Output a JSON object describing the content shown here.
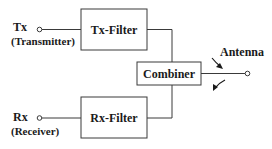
{
  "diagram": {
    "tx": {
      "label": "Tx",
      "sublabel": "(Transmitter)"
    },
    "rx": {
      "label": "Rx",
      "sublabel": "(Receiver)"
    },
    "tx_filter": {
      "label": "Tx-Filter"
    },
    "rx_filter": {
      "label": "Rx-Filter"
    },
    "combiner": {
      "label": "Combiner"
    },
    "antenna": {
      "label": "Antenna"
    },
    "colors": {
      "line": "#3a3a3a",
      "text": "#1a1a1a",
      "background": "#ffffff"
    }
  }
}
